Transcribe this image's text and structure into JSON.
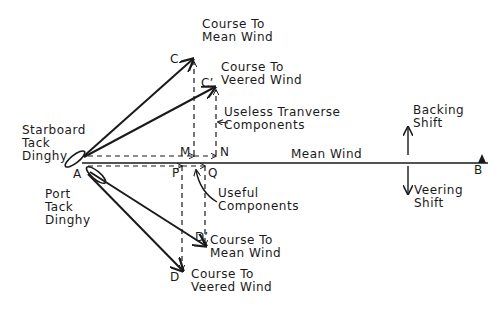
{
  "diagram": {
    "type": "vector diagram of sailing courses under wind shift",
    "colors": {
      "ink": "#1a1a1a",
      "background": "#ffffff"
    },
    "points": {
      "A": "A",
      "B": "B",
      "C": "C",
      "C_prime": "C’",
      "D": "D",
      "D_prime": "D’",
      "M": "M",
      "N": "N",
      "P": "P",
      "Q": "Q"
    },
    "labels": {
      "course_mean_wind_top": "Course To\nMean Wind",
      "course_veered_wind_top": "Course To\nVeered Wind",
      "useless_components": "Useless Tranverse\nComponents",
      "starboard_tack": "Starboard\nTack\nDinghy",
      "port_tack": "Port\nTack\nDinghy",
      "mean_wind": "Mean Wind",
      "useful_components": "Useful\nComponents",
      "course_mean_wind_bottom": "Course To\nMean Wind",
      "course_veered_wind_bottom": "Course To\nVeered Wind",
      "backing_shift": "Backing\nShift",
      "veering_shift": "Veering\nShift"
    }
  }
}
